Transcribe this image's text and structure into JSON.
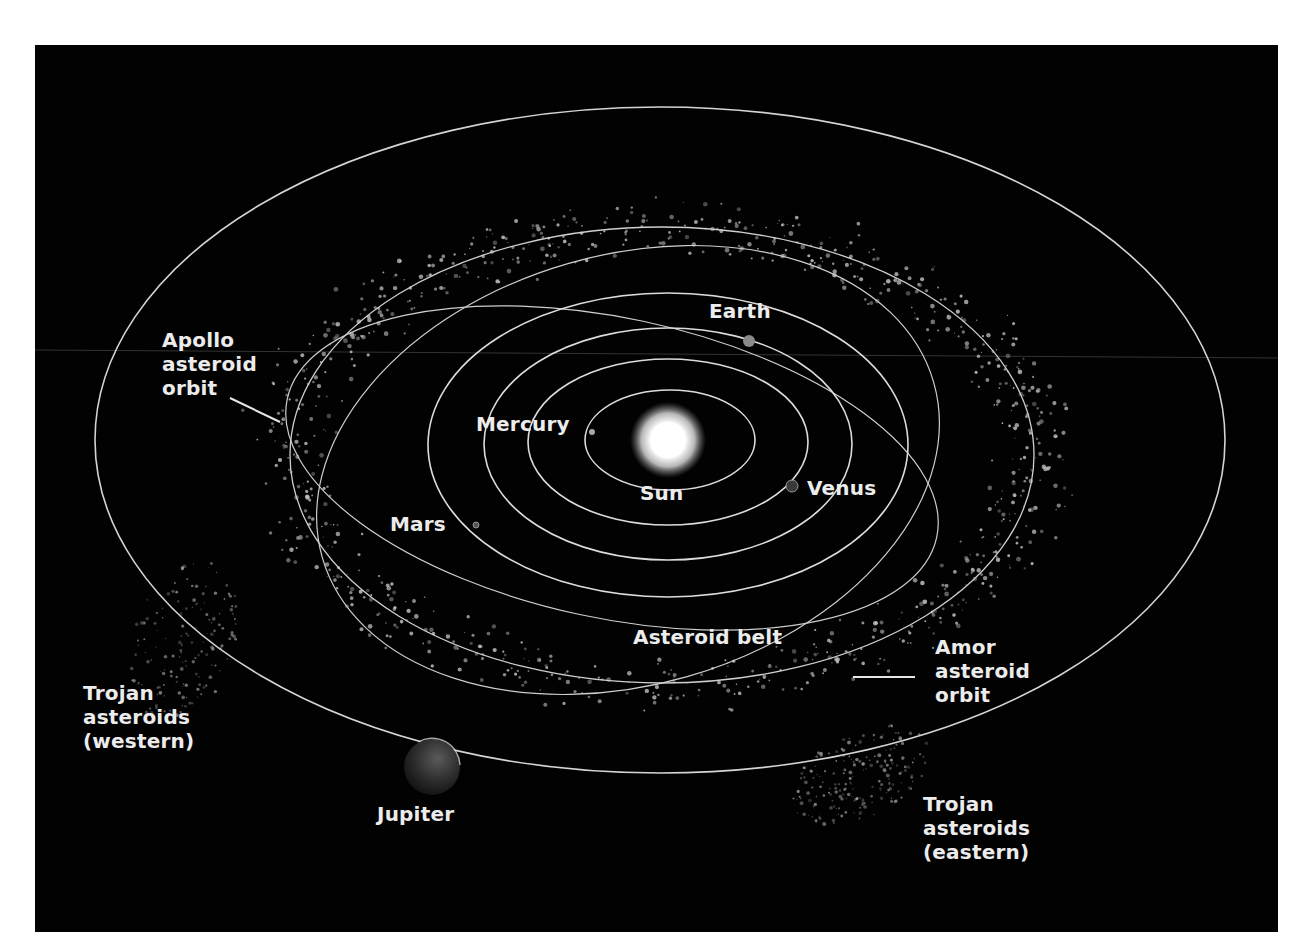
{
  "diagram": {
    "background_color": "#020202",
    "orbit_color": "#d8d8d8",
    "text_color": "#ececec",
    "labels": {
      "sun": "Sun",
      "mercury": "Mercury",
      "venus": "Venus",
      "earth": "Earth",
      "mars": "Mars",
      "jupiter": "Jupiter",
      "asteroid_belt": "Asteroid belt",
      "apollo": [
        "Apollo",
        "asteroid",
        "orbit"
      ],
      "amor": [
        "Amor",
        "asteroid",
        "orbit"
      ],
      "trojan_western": [
        "Trojan",
        "asteroids",
        "(western)"
      ],
      "trojan_eastern": [
        "Trojan",
        "asteroids",
        "(eastern)"
      ]
    }
  }
}
